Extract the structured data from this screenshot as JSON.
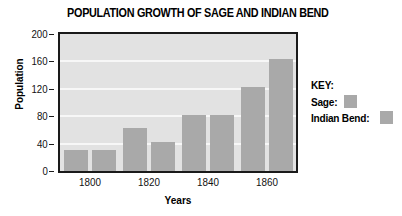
{
  "chart_data": {
    "type": "bar",
    "title": "POPULATION GROWTH OF SAGE AND INDIAN BEND",
    "xlabel": "Years",
    "ylabel": "Population",
    "categories": [
      "1800",
      "1820",
      "1840",
      "1860"
    ],
    "series": [
      {
        "name": "Sage",
        "values": [
          31,
          63,
          82,
          123
        ],
        "color": "#a9a9a9"
      },
      {
        "name": "Indian Bend",
        "values": [
          31,
          42,
          82,
          163
        ],
        "color": "#a9a9a9"
      }
    ],
    "ylim": [
      0,
      200
    ],
    "ytick_labels": [
      "200",
      "160",
      "120",
      "80",
      "40",
      "0"
    ],
    "ytick_values": [
      200,
      160,
      120,
      80,
      40,
      0
    ],
    "grid": true,
    "legend_position": "right",
    "plot_background": "#e2e2e2",
    "gridline_color": "#f7f7f7",
    "axis_color": "#1a1a1a"
  },
  "legend": {
    "title": "KEY:",
    "entries": [
      {
        "label": "Sage:",
        "swatch": "#a9a9a9"
      },
      {
        "label": "Indian Bend:",
        "swatch": "#a9a9a9"
      }
    ]
  }
}
